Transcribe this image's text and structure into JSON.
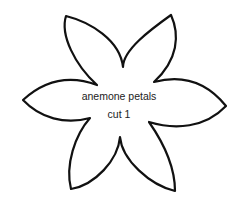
{
  "template": {
    "title_line": "anemone petals",
    "subtitle_line": "cut 1"
  },
  "colors": {
    "outline": "#111111",
    "background": "#ffffff"
  }
}
